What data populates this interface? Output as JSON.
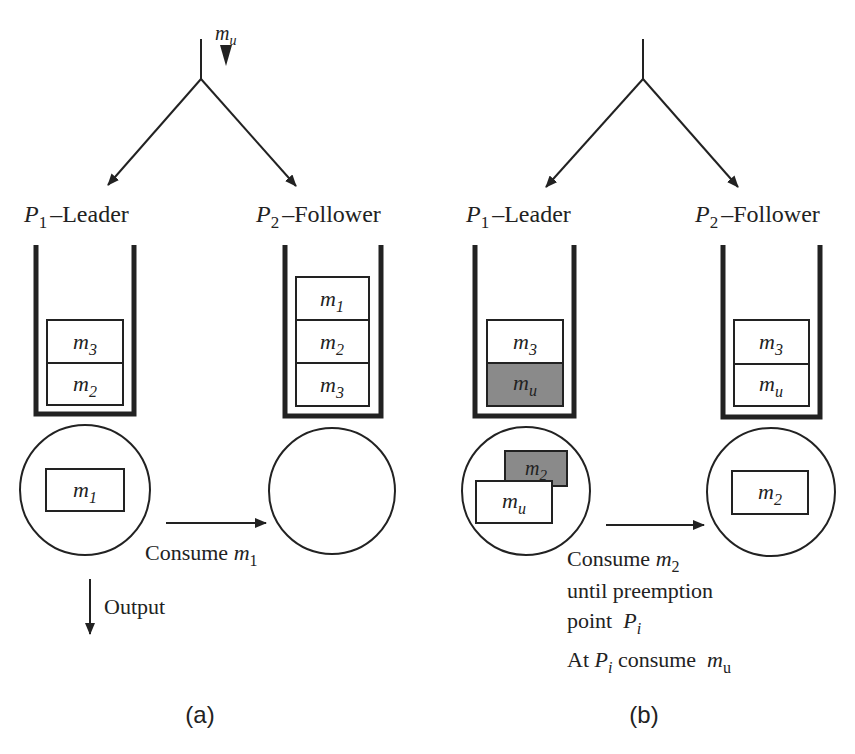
{
  "diagram": {
    "panel_a": {
      "caption": "(a)",
      "input_label": {
        "base": "m",
        "sub": "u"
      },
      "leader": {
        "label_p": "P",
        "label_sub": "1",
        "label_text": "–Leader",
        "queue": [
          {
            "base": "m",
            "sub": "3"
          },
          {
            "base": "m",
            "sub": "2"
          }
        ],
        "processing": [
          {
            "base": "m",
            "sub": "1"
          }
        ]
      },
      "follower": {
        "label_p": "P",
        "label_sub": "2",
        "label_text": "–Follower",
        "queue": [
          {
            "base": "m",
            "sub": "1"
          },
          {
            "base": "m",
            "sub": "2"
          },
          {
            "base": "m",
            "sub": "3"
          }
        ],
        "processing": []
      },
      "transfer_label": {
        "text": "Consume ",
        "base": "m",
        "sub": "1"
      },
      "output_label": "Output"
    },
    "panel_b": {
      "caption": "(b)",
      "leader": {
        "label_p": "P",
        "label_sub": "1",
        "label_text": "–Leader",
        "queue": [
          {
            "base": "m",
            "sub": "3",
            "shaded": false
          },
          {
            "base": "m",
            "sub": "u",
            "shaded": true
          }
        ],
        "processing": [
          {
            "base": "m",
            "sub": "2",
            "shaded": true
          },
          {
            "base": "m",
            "sub": "u",
            "shaded": false
          }
        ]
      },
      "follower": {
        "label_p": "P",
        "label_sub": "2",
        "label_text": "–Follower",
        "queue": [
          {
            "base": "m",
            "sub": "3"
          },
          {
            "base": "m",
            "sub": "u"
          }
        ],
        "processing": [
          {
            "base": "m",
            "sub": "2"
          }
        ]
      },
      "transfer_lines": [
        {
          "text": "Consume ",
          "base": "m",
          "sub": "2"
        },
        {
          "text": "until preemption"
        },
        {
          "text": "point  ",
          "base": "P",
          "sub": "i"
        },
        {
          "text_pre": "At ",
          "base": "P",
          "sub": "i",
          "text": " consume  ",
          "base2": "m",
          "sub2": "u"
        }
      ]
    },
    "colors": {
      "line": "#222222",
      "shade": "#8a8a8a"
    }
  }
}
